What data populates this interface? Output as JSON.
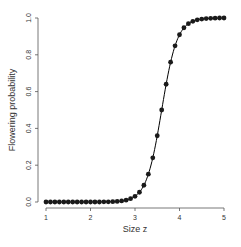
{
  "chart_data": {
    "type": "line",
    "title": "",
    "xlabel": "Size z",
    "ylabel": "Flowering probability",
    "xlim": [
      1,
      5
    ],
    "ylim": [
      0,
      1
    ],
    "x_ticks": [
      "1",
      "2",
      "3",
      "4",
      "5"
    ],
    "y_ticks": [
      "0.0",
      "0.2",
      "0.4",
      "0.6",
      "0.8",
      "1.0"
    ],
    "grid": false,
    "legend": null,
    "series": [
      {
        "name": "fitted logistic curve",
        "style": "line",
        "color": "#000000",
        "function": "1/(1+exp(-5.75*(z-3.6)))"
      },
      {
        "name": "points",
        "style": "scatter",
        "color": "#1a1a1a",
        "x": [
          1.0,
          1.1,
          1.2,
          1.3,
          1.4,
          1.5,
          1.6,
          1.7,
          1.8,
          1.9,
          2.0,
          2.1,
          2.2,
          2.3,
          2.4,
          2.5,
          2.6,
          2.7,
          2.8,
          2.9,
          3.0,
          3.1,
          3.2,
          3.3,
          3.4,
          3.5,
          3.6,
          3.7,
          3.8,
          3.9,
          4.0,
          4.1,
          4.2,
          4.3,
          4.4,
          4.5,
          4.6,
          4.7,
          4.8,
          4.9,
          5.0
        ],
        "values": [
          0.0,
          0.0,
          0.0,
          0.0,
          0.0,
          0.0,
          0.0,
          0.0,
          0.0,
          0.0,
          0.0,
          0.0,
          0.0,
          0.001,
          0.001,
          0.002,
          0.003,
          0.006,
          0.01,
          0.018,
          0.031,
          0.053,
          0.091,
          0.151,
          0.24,
          0.36,
          0.5,
          0.64,
          0.76,
          0.849,
          0.909,
          0.947,
          0.969,
          0.982,
          0.99,
          0.994,
          0.997,
          0.998,
          0.999,
          1.0,
          1.0
        ]
      }
    ]
  }
}
